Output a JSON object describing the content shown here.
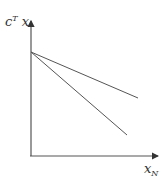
{
  "diagram": {
    "y_axis_label": {
      "base": "c",
      "superscript": "T",
      "suffix": " x"
    },
    "x_axis_label": {
      "base": "x",
      "subscript": "N"
    },
    "colors": {
      "axis": "#555555",
      "line": "#555555",
      "text": "#333333"
    },
    "lines": [
      {
        "name": "shallow-line",
        "from": [
          31,
          52
        ],
        "to": [
          138,
          98
        ]
      },
      {
        "name": "steep-line",
        "from": [
          31,
          52
        ],
        "to": [
          127,
          135
        ]
      }
    ]
  }
}
